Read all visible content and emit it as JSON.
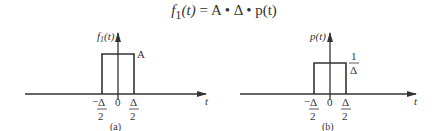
{
  "formula": {
    "lhs": "f",
    "lhs_sub": "1",
    "lhs_arg": "(t)",
    "equals": "=",
    "rhs": "A • Δ • p(t)"
  },
  "panels": [
    {
      "id": "a",
      "caption": "(a)",
      "ylabel": "f",
      "ylabel_sub": "1",
      "ylabel_arg": "(t)",
      "xlabel": "t",
      "height_label": "A",
      "ticks": [
        {
          "label_num": "Δ",
          "label_den": "2",
          "sign": "−"
        },
        {
          "label": "0"
        },
        {
          "label_num": "Δ",
          "label_den": "2",
          "sign": ""
        }
      ]
    },
    {
      "id": "b",
      "caption": "(b)",
      "ylabel": "p(t)",
      "xlabel": "t",
      "height_label_num": "1",
      "height_label_den": "Δ",
      "ticks": [
        {
          "label_num": "Δ",
          "label_den": "2",
          "sign": "−"
        },
        {
          "label": "0"
        },
        {
          "label_num": "Δ",
          "label_den": "2",
          "sign": ""
        }
      ]
    }
  ],
  "colors": {
    "line": "#333333",
    "text": "#333333"
  }
}
